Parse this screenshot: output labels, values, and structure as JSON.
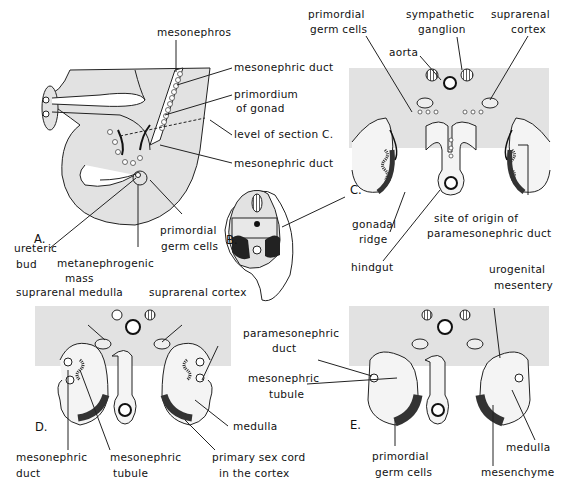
{
  "figure": {
    "panels": [
      "A.",
      "B.",
      "C.",
      "D.",
      "E."
    ],
    "colors": {
      "background_tissue": "#e2e2e2",
      "outline": "#111111",
      "gonad_dark": "#3a3a3a",
      "gonad_light": "#f4f4f4"
    }
  },
  "panel_a": {
    "label": "A.",
    "labels": {
      "mesonephros": "mesonephros",
      "mesonephric_duct_top": "mesonephric duct",
      "primordium_1": "primordium",
      "primordium_2": "of gonad",
      "level_of_section": "level of section C.",
      "mesonephric_duct_bottom": "mesonephric duct",
      "ureteric_1": "ureteric",
      "ureteric_2": "bud",
      "metanephrogenic_1": "metanephrogenic",
      "metanephrogenic_2": "mass",
      "primordial_1": "primordial",
      "primordial_2": "germ cells"
    }
  },
  "panel_b": {
    "label": "B."
  },
  "panel_c": {
    "label": "C.",
    "labels": {
      "primordial_1": "primordial",
      "primordial_2": "germ cells",
      "sympathetic_1": "sympathetic",
      "sympathetic_2": "ganglion",
      "suprarenal_1": "suprarenal",
      "suprarenal_2": "cortex",
      "aorta": "aorta",
      "gonadal_1": "gonadal",
      "gonadal_2": "ridge",
      "site_1": "site of origin of",
      "site_2": "paramesonephric duct",
      "hindgut": "hindgut"
    }
  },
  "panel_d": {
    "label": "D.",
    "labels": {
      "suprarenal_medulla": "suprarenal medulla",
      "suprarenal_cortex": "suprarenal cortex",
      "paramesonephric_1": "paramesonephric",
      "paramesonephric_2": "duct",
      "medulla": "medulla",
      "mesonephric_duct_1": "mesonephric",
      "mesonephric_duct_2": "duct",
      "mesonephric_tubule_1": "mesonephric",
      "mesonephric_tubule_2": "tubule",
      "sex_cord_1": "primary sex cord",
      "sex_cord_2": "in the cortex"
    }
  },
  "panel_e": {
    "label": "E.",
    "labels": {
      "urogenital_1": "urogenital",
      "urogenital_2": "mesentery",
      "mesonephric_tubule_1": "mesonephric",
      "mesonephric_tubule_2": "tubule",
      "primordial_1": "primordial",
      "primordial_2": "germ cells",
      "medulla": "medulla",
      "mesenchyme": "mesenchyme"
    }
  }
}
